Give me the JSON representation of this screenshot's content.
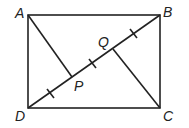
{
  "diagram": {
    "type": "geometry",
    "shape": "rectangle ABCD with diagonal DB and perpendiculars AP, CQ",
    "labels": {
      "A": "A",
      "B": "B",
      "C": "C",
      "D": "D",
      "P": "P",
      "Q": "Q"
    },
    "points": {
      "A": [
        28,
        15
      ],
      "B": [
        160,
        15
      ],
      "C": [
        160,
        108
      ],
      "D": [
        28,
        108
      ],
      "P": [
        72,
        77
      ],
      "Q": [
        113,
        49
      ]
    },
    "tick_marks": 3,
    "stroke_color": "#222222"
  }
}
